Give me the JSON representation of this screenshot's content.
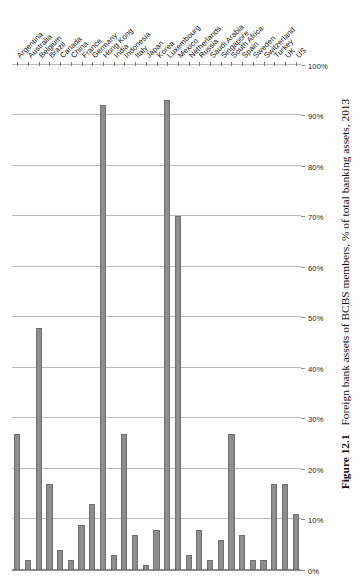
{
  "figure": {
    "number_label": "Figure 12.1",
    "caption": "Foreign bank assets of BCBS members, % of total banking assets, 2013"
  },
  "axis": {
    "value_ticks": [
      "0%",
      "10%",
      "20%",
      "30%",
      "40%",
      "50%",
      "60%",
      "70%",
      "80%",
      "90%",
      "100%"
    ]
  },
  "colors": {
    "bar_fill": "#8d8d8d",
    "bar_stroke": "#6f6f6f",
    "gridline": "#b9b9b9",
    "axis": "#8b8b8b",
    "text": "#111111"
  },
  "chart_data": {
    "type": "bar",
    "orientation": "vertical-printed-sideways",
    "title": "Foreign bank assets of BCBS members, % of total banking assets, 2013",
    "xlabel": "",
    "ylabel": "% of total banking assets",
    "ylim": [
      0,
      100
    ],
    "grid": true,
    "legend": "none",
    "tick_step": 10,
    "categories": [
      "Argentina",
      "Australia",
      "Belgium",
      "Brazil",
      "Canada",
      "China",
      "France",
      "Germany",
      "Hong Kong",
      "India",
      "Indonesia",
      "Italy",
      "Japan",
      "Korea",
      "Luxembourg",
      "Mexico",
      "Netherlands",
      "Russia",
      "Saudi Arabia",
      "Singapore",
      "South Africa",
      "Spain",
      "Sweden",
      "Switzerland",
      "Turkey",
      "UK",
      "US"
    ],
    "values": [
      27,
      2,
      48,
      17,
      4,
      2,
      9,
      13,
      92,
      3,
      27,
      7,
      1,
      8,
      93,
      70,
      3,
      8,
      2,
      6,
      27,
      7,
      2,
      2,
      17,
      17,
      11
    ]
  }
}
